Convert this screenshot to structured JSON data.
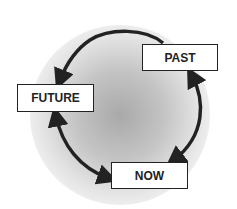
{
  "diagram": {
    "type": "cycle",
    "nodes": [
      {
        "id": "past",
        "label": "PAST"
      },
      {
        "id": "future",
        "label": "FUTURE"
      },
      {
        "id": "now",
        "label": "NOW"
      }
    ],
    "edges": [
      {
        "from": "past",
        "to": "future",
        "direction": "single"
      },
      {
        "from": "past",
        "to": "now",
        "direction": "double"
      },
      {
        "from": "future",
        "to": "now",
        "direction": "double"
      }
    ],
    "colors": {
      "arrow": "#222222",
      "box_border": "#222222",
      "box_fill": "#ffffff",
      "glow": "#a9a9a9"
    }
  }
}
